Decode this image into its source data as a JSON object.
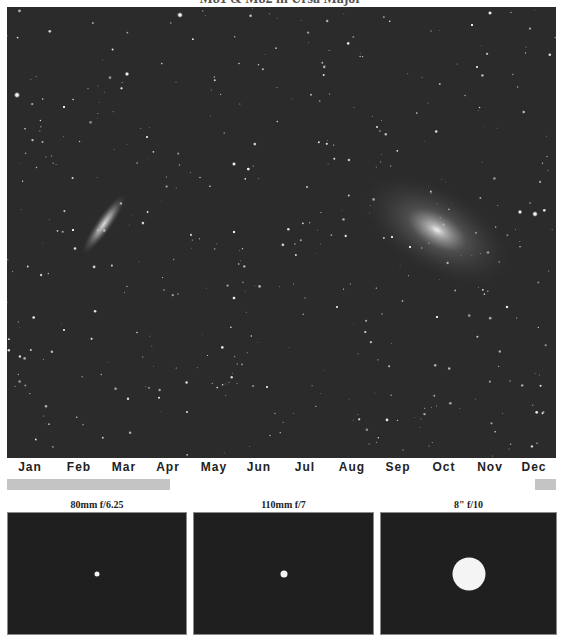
{
  "title_cut_off": "M81 & M82 in Ursa Major",
  "sky_image": {
    "description": "Star field astrophoto",
    "background_color": "#2b2b2b",
    "objects": [
      {
        "name": "M82",
        "type": "edge-on galaxy",
        "cx": 104,
        "cy": 224,
        "rx": 8,
        "ry": 36,
        "rotation": 35
      },
      {
        "name": "M81",
        "type": "spiral galaxy",
        "cx": 437,
        "cy": 230,
        "rx": 82,
        "ry": 42,
        "rotation": 30
      }
    ]
  },
  "month_axis": {
    "labels": [
      "Jan",
      "Feb",
      "Mar",
      "Apr",
      "May",
      "Jun",
      "Jul",
      "Aug",
      "Sep",
      "Oct",
      "Nov",
      "Dec"
    ],
    "positions_px": [
      30,
      79,
      124,
      168,
      214,
      259,
      305,
      352,
      398,
      444,
      490,
      534
    ]
  },
  "visibility": {
    "color": "#c4c4c4",
    "bars": [
      {
        "label": "Jan-Mar",
        "left": 7,
        "width": 163
      },
      {
        "label": "Dec",
        "left": 535,
        "width": 21
      }
    ]
  },
  "fov_panels": [
    {
      "label": "80mm f/6.25",
      "left": 7,
      "width": 180,
      "object_diameter": 5
    },
    {
      "label": "110mm f/7",
      "left": 193,
      "width": 181,
      "object_diameter": 7
    },
    {
      "label": "8\" f/10",
      "left": 380,
      "width": 177,
      "object_diameter": 33
    }
  ]
}
